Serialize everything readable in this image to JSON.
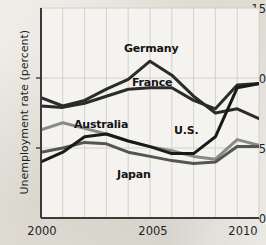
{
  "chart_data": {
    "type": "line",
    "title": "",
    "subtitle": "",
    "xlabel": "",
    "ylabel": "Unemployment rate (percent)",
    "xlim": [
      2000,
      2010
    ],
    "ylim": [
      0,
      15
    ],
    "x": [
      2000,
      2001,
      2002,
      2003,
      2004,
      2005,
      2006,
      2007,
      2008,
      2009,
      2010
    ],
    "yticks": [
      0,
      5,
      10,
      15
    ],
    "ytick_labels": [
      "0",
      "5",
      "10",
      "15"
    ],
    "xticks": [
      2000,
      2005,
      2010
    ],
    "xtick_labels": [
      "2000",
      "2005",
      "2010"
    ],
    "grid": true,
    "grid_x_every": 1,
    "legend_position": "inline-annotations",
    "series": [
      {
        "name": "Germany",
        "color": "#2b2b2b",
        "values": [
          8.6,
          8.0,
          8.4,
          9.2,
          9.9,
          11.2,
          10.2,
          8.7,
          7.5,
          7.8,
          7.1
        ]
      },
      {
        "name": "France",
        "color": "#2b2b2b",
        "values": [
          8.0,
          7.9,
          8.2,
          8.7,
          9.2,
          9.3,
          9.3,
          8.4,
          7.8,
          9.5,
          9.6
        ]
      },
      {
        "name": "Australia",
        "color": "#8a8a8a",
        "values": [
          6.3,
          6.8,
          6.4,
          6.0,
          5.5,
          5.1,
          4.8,
          4.4,
          4.2,
          5.6,
          5.2
        ]
      },
      {
        "name": "Japan",
        "color": "#555555",
        "values": [
          4.7,
          5.0,
          5.4,
          5.3,
          4.7,
          4.4,
          4.1,
          3.9,
          4.0,
          5.1,
          5.1
        ]
      },
      {
        "name": "U.S.",
        "color": "#1a1a1a",
        "values": [
          4.0,
          4.7,
          5.8,
          6.0,
          5.5,
          5.1,
          4.6,
          4.6,
          5.8,
          9.3,
          9.6
        ]
      }
    ],
    "annotations": [
      {
        "text": "Germany",
        "x_px": 124,
        "y_px": 42
      },
      {
        "text": "France",
        "x_px": 132,
        "y_px": 76
      },
      {
        "text": "Australia",
        "x_px": 74,
        "y_px": 118
      },
      {
        "text": "U.S.",
        "x_px": 174,
        "y_px": 124
      },
      {
        "text": "Japan",
        "x_px": 117,
        "y_px": 168
      }
    ]
  }
}
